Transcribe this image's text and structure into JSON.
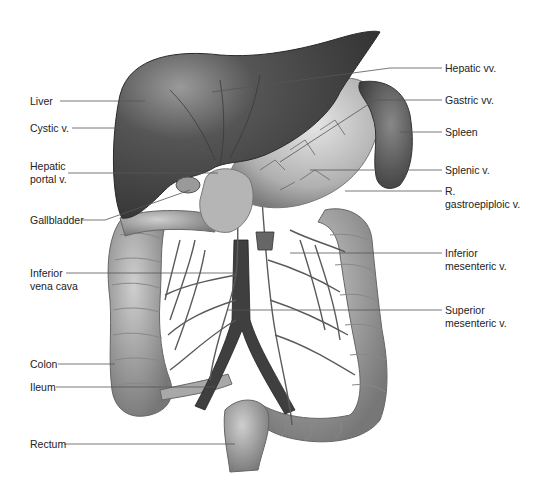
{
  "diagram": {
    "colors": {
      "organ_dark": "#4a4a4a",
      "organ_mid": "#7a7a7a",
      "organ_light": "#b8b8b8",
      "vessel": "#5a5a5a",
      "leader_line": "#555555",
      "text": "#222222"
    },
    "labels_left": [
      {
        "id": "liver",
        "text": "Liver",
        "x": 30,
        "y": 95,
        "line_y": 101,
        "line_to": [
          145,
          101
        ]
      },
      {
        "id": "cystic-v",
        "text": "Cystic v.",
        "x": 30,
        "y": 122,
        "line_y": 128,
        "line_to": [
          215,
          155
        ]
      },
      {
        "id": "hepatic-portal-v",
        "text": "Hepatic\nportal v.",
        "x": 30,
        "y": 160,
        "line_y": 173,
        "line_to": [
          218,
          173
        ]
      },
      {
        "id": "gallbladder",
        "text": "Gallbladder",
        "x": 30,
        "y": 214,
        "line_y": 220,
        "line_to": [
          190,
          190
        ]
      },
      {
        "id": "inferior-vena-cava",
        "text": "Inferior\nvena cava",
        "x": 30,
        "y": 268,
        "line_y": 273,
        "line_to": [
          235,
          273
        ]
      },
      {
        "id": "colon",
        "text": "Colon",
        "x": 30,
        "y": 361,
        "line_y": 364,
        "line_to": [
          115,
          364
        ]
      },
      {
        "id": "ileum",
        "text": "Ileum",
        "x": 30,
        "y": 383,
        "line_y": 387,
        "line_to": [
          215,
          387
        ]
      },
      {
        "id": "rectum",
        "text": "Rectum",
        "x": 30,
        "y": 438,
        "line_y": 444,
        "line_to": [
          235,
          444
        ]
      }
    ],
    "labels_right": [
      {
        "id": "hepatic-vv",
        "text": "Hepatic vv.",
        "x": 445,
        "y": 63,
        "line_y": 68,
        "line_from": [
          212,
          92
        ]
      },
      {
        "id": "gastric-vv",
        "text": "Gastric vv.",
        "x": 445,
        "y": 95,
        "line_y": 100,
        "line_from": [
          280,
          162
        ]
      },
      {
        "id": "spleen",
        "text": "Spleen",
        "x": 445,
        "y": 127,
        "line_y": 132,
        "line_from": [
          400,
          132
        ]
      },
      {
        "id": "splenic-v",
        "text": "Splenic v.",
        "x": 445,
        "y": 165,
        "line_y": 170,
        "line_from": [
          310,
          170
        ]
      },
      {
        "id": "r-gastroepiploic-v",
        "text": "R.\ngastroepiploic v.",
        "x": 445,
        "y": 186,
        "line_y": 191,
        "line_from": [
          345,
          191
        ]
      },
      {
        "id": "inferior-mesenteric-v",
        "text": "Inferior\nmesenteric v.",
        "x": 445,
        "y": 247,
        "line_y": 253,
        "line_from": [
          290,
          253
        ]
      },
      {
        "id": "superior-mesenteric-v",
        "text": "Superior\nmesenteric v.",
        "x": 445,
        "y": 305,
        "line_y": 310,
        "line_from": [
          228,
          310
        ]
      }
    ]
  }
}
